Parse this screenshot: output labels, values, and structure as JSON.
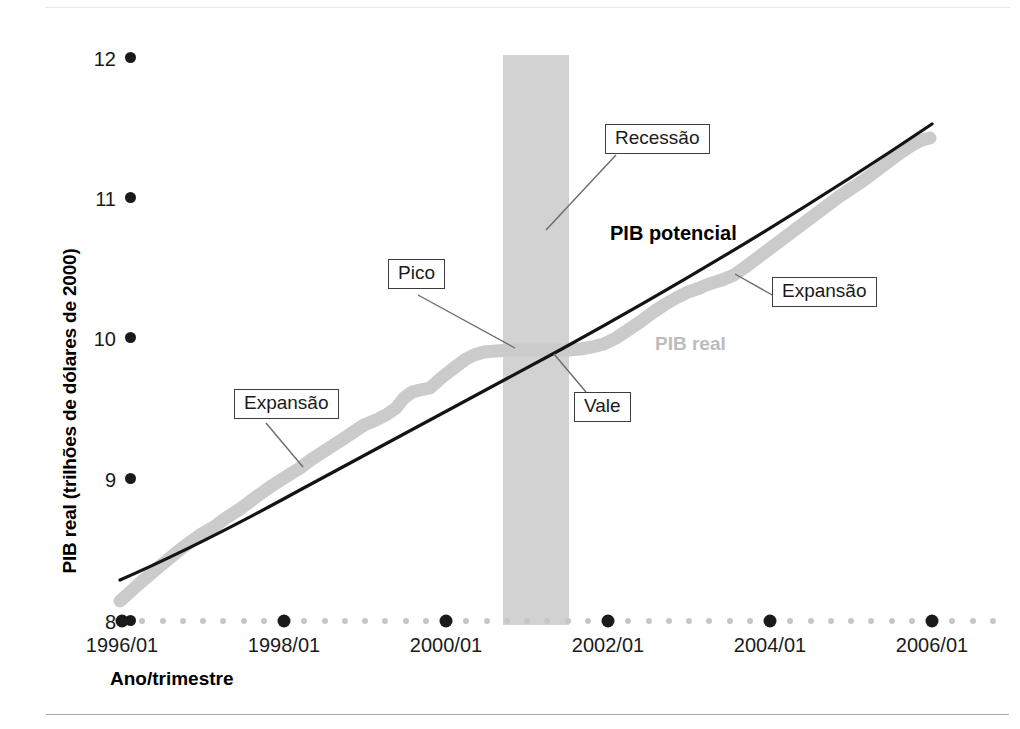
{
  "chart_data": {
    "type": "line",
    "title": "",
    "xlabel": "Ano/trimestre",
    "ylabel": "PIB real (trilhões de dólares de 2000)",
    "ylim": [
      8,
      12
    ],
    "xlim": [
      "1996/01",
      "2006/04"
    ],
    "ytick_labels": [
      "12",
      "11",
      "10",
      "9",
      "8"
    ],
    "ytick_values": [
      12,
      11,
      10,
      9,
      8
    ],
    "xtick_labels": [
      "1996/01",
      "1998/01",
      "2000/01",
      "2002/01",
      "2004/01",
      "2006/01"
    ],
    "grid": false,
    "legend_position": "inline-annotations",
    "series": [
      {
        "name": "PIB potencial",
        "color": "#141414",
        "style": "solid-thin",
        "x": [
          "1996/01",
          "1998/01",
          "2000/01",
          "2002/01",
          "2004/01",
          "2006/01",
          "2006/04"
        ],
        "values": [
          8.35,
          8.93,
          9.52,
          10.12,
          10.72,
          11.3,
          11.45
        ]
      },
      {
        "name": "PIB real",
        "color": "#c9c9c9",
        "style": "thick-band",
        "x": [
          "1996/01",
          "1996/03",
          "1997/01",
          "1997/03",
          "1998/01",
          "1998/03",
          "1999/01",
          "1999/03",
          "2000/01",
          "2000/03",
          "2001/01",
          "2001/03",
          "2002/01",
          "2002/03",
          "2003/01",
          "2003/03",
          "2004/01",
          "2004/03",
          "2005/01",
          "2005/03",
          "2006/01",
          "2006/04"
        ],
        "values": [
          8.3,
          8.52,
          8.72,
          8.88,
          9.07,
          9.25,
          9.42,
          9.62,
          9.83,
          9.95,
          9.99,
          9.98,
          9.99,
          10.05,
          10.2,
          10.4,
          10.55,
          10.62,
          10.82,
          11.0,
          11.18,
          11.36
        ]
      }
    ],
    "shaded_regions": [
      {
        "name": "Recessão",
        "color": "#d2d2d2",
        "x_start": "2001/01",
        "x_end": "2001/04"
      }
    ],
    "annotations": [
      {
        "id": "expansao-left",
        "text": "Expansão"
      },
      {
        "id": "pico",
        "text": "Pico"
      },
      {
        "id": "recessao",
        "text": "Recessão"
      },
      {
        "id": "vale",
        "text": "Vale"
      },
      {
        "id": "expansao-right",
        "text": "Expansão"
      }
    ],
    "series_labels": [
      {
        "id": "pib-potencial",
        "text": "PIB potencial",
        "color": "#000000"
      },
      {
        "id": "pib-real",
        "text": "PIB real",
        "color": "#bcbcbc"
      }
    ]
  }
}
